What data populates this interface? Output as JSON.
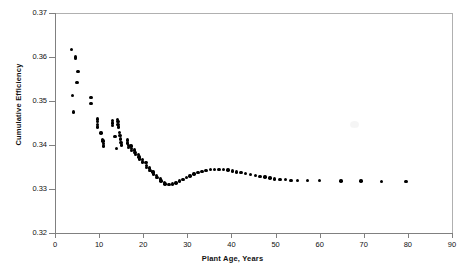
{
  "chart_data": {
    "type": "scatter",
    "title": "",
    "xlabel": "Plant Age, Years",
    "ylabel": "Cumulative Efficiency",
    "xlim": [
      0,
      90
    ],
    "ylim": [
      0.32,
      0.37
    ],
    "xticks": [
      0,
      10,
      20,
      30,
      40,
      50,
      60,
      70,
      80,
      90
    ],
    "xtick_labels": [
      "0",
      "10",
      "20",
      "30",
      "40",
      "50",
      "60",
      "70",
      "80",
      "90"
    ],
    "yticks": [
      0.32,
      0.33,
      0.34,
      0.35,
      0.36,
      0.37
    ],
    "ytick_labels": [
      "0.32",
      "0.33",
      "0.34",
      "0.35",
      "0.36",
      "0.37"
    ],
    "grid": false,
    "legend": null,
    "marker": "filled-circle",
    "marker_color": "#000000",
    "points": [
      [
        3.8,
        0.3617
      ],
      [
        4.6,
        0.36
      ],
      [
        4.6,
        0.3597
      ],
      [
        5.2,
        0.3567
      ],
      [
        5.0,
        0.3542
      ],
      [
        4.0,
        0.3513
      ],
      [
        4.2,
        0.3475
      ],
      [
        8.2,
        0.3508
      ],
      [
        8.2,
        0.3494
      ],
      [
        9.6,
        0.3459
      ],
      [
        9.6,
        0.3453
      ],
      [
        9.7,
        0.3447
      ],
      [
        9.7,
        0.3441
      ],
      [
        10.4,
        0.3427
      ],
      [
        10.8,
        0.3413
      ],
      [
        10.9,
        0.3409
      ],
      [
        11.0,
        0.3404
      ],
      [
        11.0,
        0.3398
      ],
      [
        13.0,
        0.3456
      ],
      [
        13.1,
        0.345
      ],
      [
        13.1,
        0.3444
      ],
      [
        13.6,
        0.342
      ],
      [
        14.2,
        0.3458
      ],
      [
        14.3,
        0.3453
      ],
      [
        14.3,
        0.3447
      ],
      [
        14.4,
        0.3441
      ],
      [
        14.6,
        0.3428
      ],
      [
        14.7,
        0.3421
      ],
      [
        14.8,
        0.3414
      ],
      [
        15.0,
        0.3406
      ],
      [
        15.1,
        0.34
      ],
      [
        14.0,
        0.3392
      ],
      [
        16.4,
        0.3411
      ],
      [
        16.5,
        0.3405
      ],
      [
        16.6,
        0.3399
      ],
      [
        16.7,
        0.3394
      ],
      [
        17.2,
        0.3398
      ],
      [
        17.3,
        0.3392
      ],
      [
        17.4,
        0.3387
      ],
      [
        18.0,
        0.3389
      ],
      [
        18.1,
        0.3383
      ],
      [
        18.2,
        0.3378
      ],
      [
        18.9,
        0.3379
      ],
      [
        19.0,
        0.3373
      ],
      [
        19.1,
        0.3368
      ],
      [
        19.8,
        0.3367
      ],
      [
        19.9,
        0.3361
      ],
      [
        20.6,
        0.336
      ],
      [
        20.7,
        0.3354
      ],
      [
        20.8,
        0.3349
      ],
      [
        21.4,
        0.3348
      ],
      [
        21.5,
        0.3342
      ],
      [
        22.2,
        0.3339
      ],
      [
        22.3,
        0.3334
      ],
      [
        23.0,
        0.3331
      ],
      [
        23.1,
        0.3326
      ],
      [
        23.9,
        0.3323
      ],
      [
        24.0,
        0.3318
      ],
      [
        24.8,
        0.3315
      ],
      [
        24.9,
        0.3311
      ],
      [
        25.8,
        0.331
      ],
      [
        26.6,
        0.3311
      ],
      [
        27.4,
        0.3314
      ],
      [
        28.2,
        0.3318
      ],
      [
        29.0,
        0.3322
      ],
      [
        29.8,
        0.3326
      ],
      [
        30.6,
        0.333
      ],
      [
        31.5,
        0.3334
      ],
      [
        32.4,
        0.3337
      ],
      [
        33.3,
        0.334
      ],
      [
        34.2,
        0.3342
      ],
      [
        35.2,
        0.3344
      ],
      [
        36.2,
        0.3345
      ],
      [
        37.2,
        0.3345
      ],
      [
        38.2,
        0.3344
      ],
      [
        39.2,
        0.3343
      ],
      [
        40.2,
        0.3341
      ],
      [
        41.2,
        0.3339
      ],
      [
        42.2,
        0.3337
      ],
      [
        43.2,
        0.3335
      ],
      [
        44.3,
        0.3333
      ],
      [
        45.4,
        0.3331
      ],
      [
        46.5,
        0.3329
      ],
      [
        47.6,
        0.3327
      ],
      [
        48.7,
        0.3325
      ],
      [
        49.8,
        0.3323
      ],
      [
        51.0,
        0.3322
      ],
      [
        52.2,
        0.3321
      ],
      [
        53.5,
        0.332
      ],
      [
        55.0,
        0.332
      ],
      [
        57.2,
        0.3319
      ],
      [
        60.0,
        0.3319
      ],
      [
        64.8,
        0.3318
      ],
      [
        69.4,
        0.3318
      ],
      [
        74.0,
        0.3317
      ],
      [
        79.6,
        0.3317
      ]
    ]
  }
}
